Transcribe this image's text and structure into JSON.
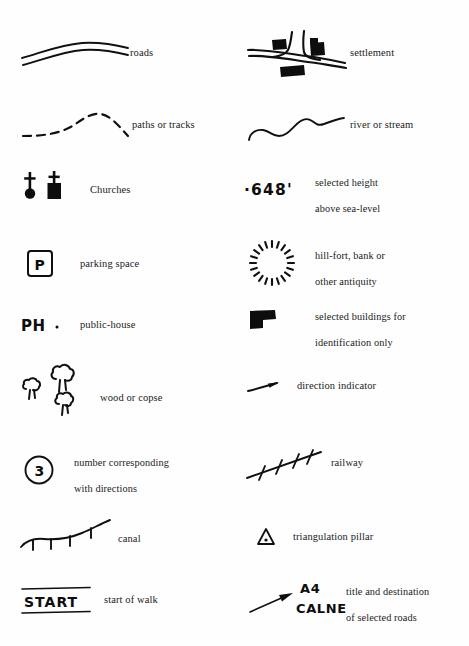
{
  "document": {
    "kind": "map-legend",
    "title": "Map symbols key",
    "background_color": "#fefefe",
    "ink_color": "#101010",
    "width": 469,
    "height": 646
  },
  "columns": [
    {
      "id": "left",
      "x": 18
    },
    {
      "id": "right",
      "x": 246
    }
  ],
  "entries": [
    {
      "id": "roads",
      "column": "left",
      "row": 1,
      "symbol": "double-line-road",
      "label": "roads",
      "label_lines": [
        "roads"
      ]
    },
    {
      "id": "settlement",
      "column": "right",
      "row": 1,
      "symbol": "crossroads-with-buildings",
      "label": "settlement",
      "label_lines": [
        "settlement"
      ]
    },
    {
      "id": "paths-or-tracks",
      "column": "left",
      "row": 2,
      "symbol": "dashed-line",
      "label": "paths or tracks",
      "label_lines": [
        "paths or tracks"
      ]
    },
    {
      "id": "river-or-stream",
      "column": "right",
      "row": 2,
      "symbol": "wavy-line",
      "label": "river or stream",
      "label_lines": [
        "river or stream"
      ]
    },
    {
      "id": "churches",
      "column": "left",
      "row": 3,
      "symbol": "church-tower-and-spire",
      "label": "Churches",
      "label_lines": [
        "Churches"
      ]
    },
    {
      "id": "selected-height",
      "column": "right",
      "row": 3,
      "symbol": "spot-height-dot",
      "symbol_text": "·648'",
      "label": "selected height above sea-level",
      "label_lines": [
        "selected height",
        "above sea-level"
      ]
    },
    {
      "id": "parking-space",
      "column": "left",
      "row": 4,
      "symbol": "boxed-letter-p",
      "symbol_text": "P",
      "label": "parking space",
      "label_lines": [
        "parking space"
      ]
    },
    {
      "id": "hill-fort",
      "column": "right",
      "row": 4,
      "symbol": "radial-tick-circle",
      "label": "hill-fort, bank or other antiquity",
      "label_lines": [
        "hill-fort, bank or",
        "other antiquity"
      ]
    },
    {
      "id": "public-house",
      "column": "left",
      "row": 5,
      "symbol": "ph-letters-with-dot",
      "symbol_text": "PH",
      "label": "public-house",
      "label_lines": [
        "public-house"
      ]
    },
    {
      "id": "selected-buildings",
      "column": "right",
      "row": 5,
      "symbol": "solid-l-shaped-block",
      "label": "selected buildings for identification only",
      "label_lines": [
        "selected buildings for",
        "identification only"
      ]
    },
    {
      "id": "wood-or-copse",
      "column": "left",
      "row": 6,
      "symbol": "three-tree-outlines",
      "label": "wood or copse",
      "label_lines": [
        "wood or copse"
      ]
    },
    {
      "id": "direction-indicator",
      "column": "right",
      "row": 6,
      "symbol": "small-arrow",
      "label": "direction indicator",
      "label_lines": [
        "direction indicator"
      ]
    },
    {
      "id": "number-corresponding",
      "column": "left",
      "row": 7,
      "symbol": "circled-number",
      "symbol_text": "3",
      "label": "number corresponding with directions",
      "label_lines": [
        "number corresponding",
        "with directions"
      ]
    },
    {
      "id": "railway",
      "column": "right",
      "row": 7,
      "symbol": "ticked-diagonal-line",
      "label": "railway",
      "label_lines": [
        "railway"
      ]
    },
    {
      "id": "canal",
      "column": "left",
      "row": 8,
      "symbol": "line-with-hanging-ticks",
      "label": "canal",
      "label_lines": [
        "canal"
      ]
    },
    {
      "id": "triangulation-pillar",
      "column": "right",
      "row": 8,
      "symbol": "triangle-with-dot",
      "label": "triangulation pillar",
      "label_lines": [
        "triangulation pillar"
      ]
    },
    {
      "id": "start-of-walk",
      "column": "left",
      "row": 9,
      "symbol": "ruled-start-banner",
      "symbol_text": "START",
      "label": "start of walk",
      "label_lines": [
        "start of walk"
      ]
    },
    {
      "id": "road-title-destination",
      "column": "right",
      "row": 9,
      "symbol": "arrow-with-road-labels",
      "symbol_text_line1": "A4",
      "symbol_text_line2": "CALNE",
      "label": "title and destination of selected roads",
      "label_lines": [
        "title and destination",
        "of selected roads"
      ]
    }
  ]
}
